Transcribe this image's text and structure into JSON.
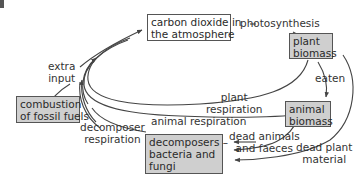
{
  "diagram": {
    "nodes": {
      "atmosphere": {
        "line1": "carbon dioxide in",
        "line2": "the atmosphere"
      },
      "plant": {
        "line1": "plant",
        "line2": "biomass"
      },
      "animal": {
        "line1": "animal",
        "line2": "biomass"
      },
      "decomposers": {
        "line1": "decomposers –",
        "line2": "bacteria and",
        "line3": "fungi"
      },
      "fossil": {
        "line1": "combustion",
        "line2": "of fossil fuels"
      }
    },
    "labels": {
      "photosynthesis": "photosynthesis",
      "eaten": "eaten",
      "extra_input_1": "extra",
      "extra_input_2": "input",
      "plant_resp_1": "plant",
      "plant_resp_2": "respiration",
      "animal_resp": "animal respiration",
      "decomp_resp_1": "decomposer",
      "decomp_resp_2": "respiration",
      "dead_animals_1": "dead animals",
      "dead_animals_2": "and faeces",
      "dead_plant_1": "dead plant",
      "dead_plant_2": "material"
    },
    "colors": {
      "grey_box": "#cfcfcf",
      "white_box": "#ffffff",
      "line": "#444444"
    }
  }
}
